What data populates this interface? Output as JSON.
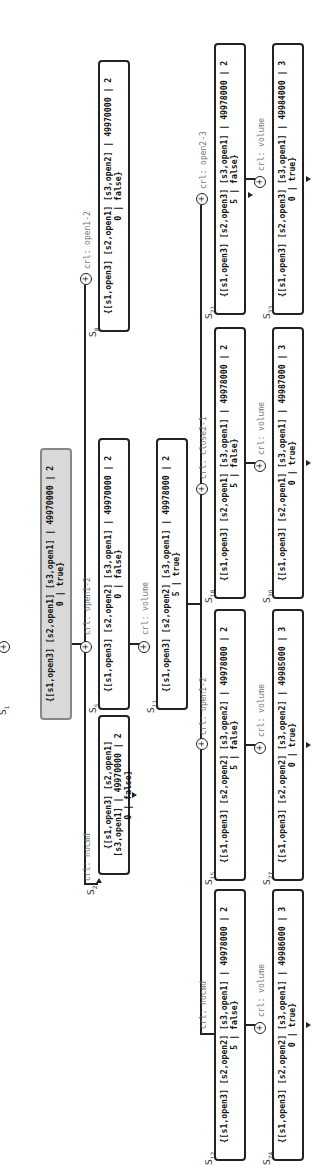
{
  "diagram": {
    "orientation": "rotated-90-ccw",
    "nodes": [
      {
        "id": "S1",
        "label_main": "S",
        "label_sub": "1",
        "text": "{[s1,open3] [s2,open1] [s3,open1] | 49970000 | 2",
        "text2": "0 | true}",
        "highlighted": true
      },
      {
        "id": "S2",
        "label_main": "S",
        "label_sub": "2",
        "text": "{[s1,open3] [s2,open1] [s3,open1] | 49970000 | 2",
        "text2": "0 | false}"
      },
      {
        "id": "S5",
        "label_main": "S",
        "label_sub": "5",
        "text": "{[s1,open3] [s2,open2] [s3,open1] | 49970000 | 2",
        "text2": "0 | false}"
      },
      {
        "id": "S8",
        "label_main": "S",
        "label_sub": "8",
        "text": "{[s1,open3] [s2,open1] [s3,open2] | 49970000 | 2",
        "text2": "0 | false}"
      },
      {
        "id": "S11",
        "label_main": "S",
        "label_sub": "11",
        "text": "{[s1,open3] [s2,open2] [s3,open1] | 49978000 | 2",
        "text2": "5 | true}"
      },
      {
        "id": "S12",
        "label_main": "S",
        "label_sub": "12",
        "text": "{[s1,open3] [s2,open2] [s3,open1] | 49978000 | 2",
        "text2": "5 | false}"
      },
      {
        "id": "S15",
        "label_main": "S",
        "label_sub": "15",
        "text": "{[s1,open3] [s2,open2] [s3,open2] | 49978000 | 2",
        "text2": "5 | false}"
      },
      {
        "id": "S18",
        "label_main": "S",
        "label_sub": "18",
        "text": "{[s1,open3] [s2,open1] [s3,open1] | 49978000 | 2",
        "text2": "5 | false}"
      },
      {
        "id": "S21",
        "label_main": "S",
        "label_sub": "21",
        "text": "{[s1,open3] [s2,open3] [s3,open1] | 49978000 | 2",
        "text2": "5 | false}"
      },
      {
        "id": "S24",
        "label_main": "S",
        "label_sub": "24",
        "text": "{[s1,open3] [s2,open2] [s3,open1] | 49986000 | 3",
        "text2": "0 | true}"
      },
      {
        "id": "S27",
        "label_main": "S",
        "label_sub": "27",
        "text": "{[s1,open3] [s2,open2] [s3,open2] | 49985000 | 3",
        "text2": "0 | true}"
      },
      {
        "id": "S30",
        "label_main": "S",
        "label_sub": "30",
        "text": "{[s1,open3] [s2,open1] [s3,open1] | 49987000 | 3",
        "text2": "0 | true}"
      },
      {
        "id": "S33",
        "label_main": "S",
        "label_sub": "33",
        "text": "{[s1,open3] [s2,open3] [s3,open1] | 49984000 | 3",
        "text2": "0 | true}"
      }
    ],
    "edges": [
      {
        "from": "S1",
        "to": "S2",
        "label": "crl: nocmd"
      },
      {
        "from": "S1",
        "to": "S5",
        "label": "crl: open1-2"
      },
      {
        "from": "S1",
        "to": "S8",
        "label": "crl: open1-2"
      },
      {
        "from": "S5",
        "to": "S11",
        "label": "crl: volume"
      },
      {
        "from": "S11",
        "to": "S12",
        "label": "crl: nocmd"
      },
      {
        "from": "S11",
        "to": "S15",
        "label": "crl: open1-2"
      },
      {
        "from": "S11",
        "to": "S18",
        "label": "crl: close2-1"
      },
      {
        "from": "S11",
        "to": "S21",
        "label": "crl: open2-3"
      },
      {
        "from": "S12",
        "to": "S24",
        "label": "crl: volume"
      },
      {
        "from": "S15",
        "to": "S27",
        "label": "crl: volume"
      },
      {
        "from": "S18",
        "to": "S30",
        "label": "crl: volume"
      },
      {
        "from": "S21",
        "to": "S33",
        "label": "crl: volume"
      }
    ],
    "plus_symbol": "+"
  }
}
